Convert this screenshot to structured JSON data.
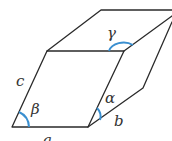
{
  "diagram": {
    "type": "parallelepiped (unit cell) with lattice parameters",
    "colors": {
      "edge": "#2a2a2a",
      "angle_arc": "#3a8fd0",
      "label": "#333333"
    },
    "labels": {
      "edge_a": "a",
      "edge_b": "b",
      "edge_c": "c",
      "angle_alpha": "α",
      "angle_beta": "β",
      "angle_gamma": "γ"
    }
  }
}
